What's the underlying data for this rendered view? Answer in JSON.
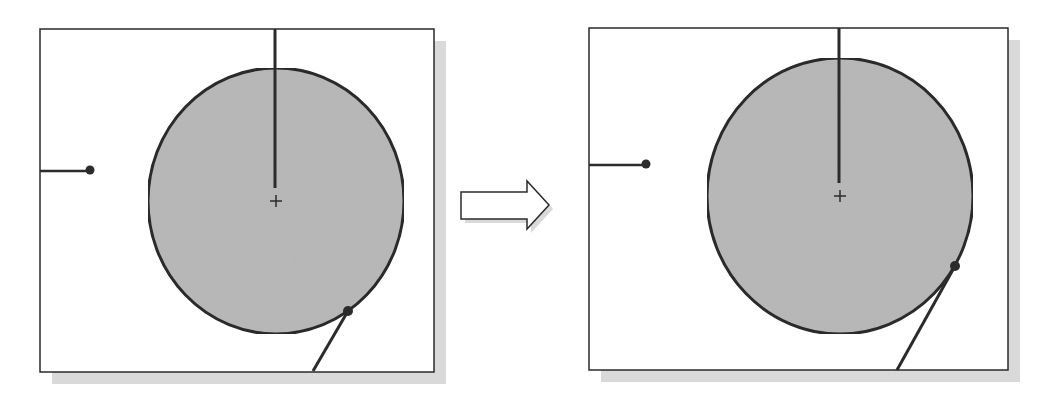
{
  "diagram": {
    "colors": {
      "background": "#ffffff",
      "frame": "#2a2a2a",
      "shadow": "#d9d9d9",
      "circle_fill": "#b9b9b9",
      "stroke": "#2b2b2b"
    },
    "panels": [
      {
        "name": "before",
        "frame": {
          "x": 40,
          "y": 29,
          "w": 394,
          "h": 343
        },
        "circle": {
          "cx": 276,
          "cy": 201,
          "rx": 128,
          "ry": 133
        },
        "center_mark": {
          "x": 276,
          "y": 201
        },
        "vertical_line": {
          "x": 275,
          "y1": 29,
          "y2": 188
        },
        "horizontal_line": {
          "x1": 40,
          "y1": 171,
          "x2": 90,
          "y2": 171
        },
        "left_dot": {
          "x": 90,
          "y": 170
        },
        "tangent_dot": {
          "x": 348,
          "y": 311
        },
        "tangent_line": {
          "x1": 348,
          "y1": 311,
          "x2": 313,
          "y2": 371
        }
      },
      {
        "name": "after",
        "frame": {
          "x": 589,
          "y": 28,
          "w": 419,
          "h": 342
        },
        "circle": {
          "cx": 840,
          "cy": 196,
          "rx": 133,
          "ry": 138
        },
        "center_mark": {
          "x": 840,
          "y": 196
        },
        "vertical_line": {
          "x": 839,
          "y1": 28,
          "y2": 183
        },
        "horizontal_line": {
          "x1": 589,
          "y1": 165,
          "x2": 646,
          "y2": 165
        },
        "left_dot": {
          "x": 646,
          "y": 164
        },
        "tangent_dot": {
          "x": 955,
          "y": 266
        },
        "tangent_line": {
          "x1": 955,
          "y1": 266,
          "x2": 897,
          "y2": 370
        }
      }
    ],
    "arrow": {
      "direction": "right",
      "points": "461,192 527,192 527,181 549,205 527,229 527,219 461,219"
    }
  }
}
